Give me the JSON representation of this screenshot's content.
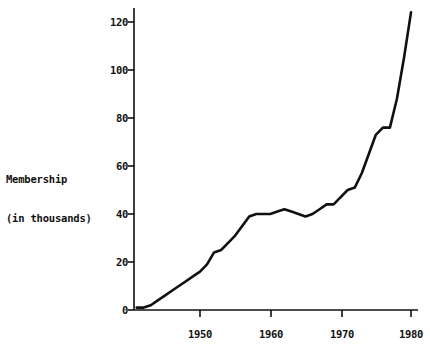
{
  "chart_data": {
    "type": "line",
    "title": "",
    "subtitle": "",
    "xlabel": "",
    "ylabel": "Membership\n(in thousands)",
    "ylabel_lines": [
      "Membership",
      "(in thousands)"
    ],
    "xlim": [
      1941,
      1980
    ],
    "ylim": [
      0,
      128
    ],
    "x_ticks": [
      1950,
      1960,
      1970,
      1980
    ],
    "x_tick_labels": [
      "1950",
      "1960",
      "1970",
      "1980"
    ],
    "y_ticks": [
      0,
      20,
      40,
      60,
      80,
      100,
      120
    ],
    "y_tick_labels": [
      "0",
      "20",
      "40",
      "60",
      "80",
      "100",
      "120"
    ],
    "grid": false,
    "legend": "none",
    "line_color": "#101010",
    "line_width": 2.6,
    "background_color": "#ffffff",
    "axis_color": "#101010",
    "series": [
      {
        "name": "Membership",
        "x": [
          1941,
          1942,
          1943,
          1944,
          1945,
          1946,
          1947,
          1948,
          1949,
          1950,
          1951,
          1952,
          1953,
          1954,
          1955,
          1956,
          1957,
          1958,
          1959,
          1960,
          1961,
          1962,
          1963,
          1964,
          1965,
          1966,
          1967,
          1968,
          1969,
          1970,
          1971,
          1972,
          1973,
          1974,
          1975,
          1976,
          1977,
          1978,
          1979,
          1980
        ],
        "y": [
          1,
          1,
          2,
          4,
          6,
          8,
          10,
          12,
          14,
          16,
          19,
          24,
          25,
          28,
          31,
          35,
          39,
          40,
          40,
          40,
          41,
          42,
          41,
          40,
          39,
          40,
          42,
          44,
          44,
          47,
          50,
          51,
          57,
          65,
          73,
          76,
          76,
          88,
          105,
          124
        ]
      }
    ]
  },
  "axes": {
    "y_axis_name": "y-axis",
    "x_axis_name": "x-axis"
  }
}
